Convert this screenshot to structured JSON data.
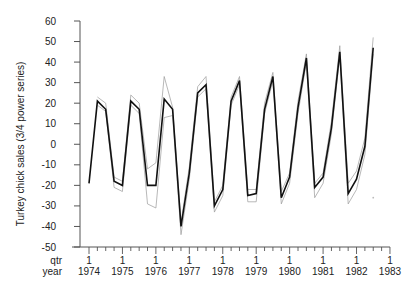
{
  "chart_data": {
    "type": "line",
    "title": "",
    "ylabel": "Turkey chick sales (3/4 power series)",
    "xlabel_rows": [
      "qtr",
      "year"
    ],
    "ylim": [
      -50,
      60
    ],
    "yticks": [
      60,
      50,
      40,
      30,
      20,
      10,
      0,
      -10,
      -20,
      -30,
      -40,
      -50
    ],
    "x_start": "1974 Q1",
    "quarters_per_year": 4,
    "xticks_major": [
      {
        "qtr": "1",
        "year": "1974"
      },
      {
        "qtr": "1",
        "year": "1975"
      },
      {
        "qtr": "1",
        "year": "1976"
      },
      {
        "qtr": "1",
        "year": "1977"
      },
      {
        "qtr": "1",
        "year": "1978"
      },
      {
        "qtr": "1",
        "year": "1979"
      },
      {
        "qtr": "1",
        "year": "1980"
      },
      {
        "qtr": "1",
        "year": "1981"
      },
      {
        "qtr": "1",
        "year": "1982"
      },
      {
        "qtr": "1",
        "year": "1983"
      }
    ],
    "grid": false,
    "legend": "none",
    "series": [
      {
        "name": "series (dark)",
        "color": "#111111",
        "width": 1.6,
        "start_index": 0,
        "values": [
          -19,
          21,
          17,
          -18,
          -20,
          21,
          17,
          -20,
          -20,
          22,
          17,
          -40,
          -14,
          25,
          29,
          -30,
          -22,
          21,
          31,
          -25,
          -24,
          17,
          33,
          -26,
          -16,
          18,
          42,
          -21,
          -16,
          8,
          45,
          -24,
          -17,
          -1,
          47
        ]
      },
      {
        "name": "upper band",
        "color": "#9a9a9a",
        "width": 0.7,
        "start_index": 1,
        "values": [
          23,
          20,
          -16,
          -18,
          24,
          20,
          -12,
          -9,
          33,
          18,
          -38,
          -11,
          28,
          33,
          -28,
          -20,
          23,
          33,
          -22,
          -22,
          20,
          35,
          -23,
          -14,
          21,
          44,
          -19,
          -14,
          11,
          48,
          -19,
          -13,
          3,
          52
        ]
      },
      {
        "name": "lower band",
        "color": "#9a9a9a",
        "width": 0.7,
        "start_index": 1,
        "values": [
          19,
          16,
          -21,
          -23,
          19,
          15,
          -29,
          -31,
          13,
          14,
          -44,
          -17,
          23,
          27,
          -33,
          -25,
          19,
          29,
          -28,
          -28,
          15,
          31,
          -29,
          -19,
          15,
          40,
          -26,
          -19,
          5,
          43,
          -29,
          -22,
          -5,
          44
        ]
      },
      {
        "name": "stray point",
        "color": "#bbbbbb",
        "type": "point",
        "index": 34,
        "value": -26
      }
    ]
  }
}
